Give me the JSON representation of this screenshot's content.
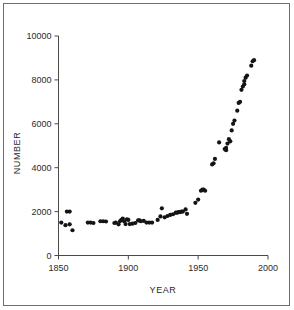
{
  "figure": {
    "caption": "",
    "background_color": "#ffffff",
    "border_color": "#6e6e6e",
    "marker_color": "#141414",
    "axis_color": "#4a4a4a"
  },
  "chart_data": {
    "type": "scatter",
    "title": "",
    "xlabel": "YEAR",
    "ylabel": "NUMBER",
    "xlim": [
      1850,
      2000
    ],
    "ylim": [
      0,
      10000
    ],
    "xticks": [
      1850,
      1900,
      1950,
      2000
    ],
    "xtick_labels": [
      "1850",
      "1900",
      "1950",
      "2000"
    ],
    "yticks": [
      0,
      2000,
      4000,
      6000,
      8000,
      10000
    ],
    "ytick_labels": [
      "0",
      "2000",
      "4000",
      "6000",
      "8000",
      "10000"
    ],
    "grid": false,
    "legend": null,
    "marker": "filled-circle",
    "marker_size_px": 3,
    "series": [
      {
        "name": "Number",
        "points": [
          [
            1852,
            1500
          ],
          [
            1855,
            1380
          ],
          [
            1856,
            2000
          ],
          [
            1858,
            2000
          ],
          [
            1858,
            1420
          ],
          [
            1860,
            1150
          ],
          [
            1871,
            1500
          ],
          [
            1873,
            1500
          ],
          [
            1875,
            1480
          ],
          [
            1880,
            1560
          ],
          [
            1882,
            1560
          ],
          [
            1884,
            1550
          ],
          [
            1890,
            1480
          ],
          [
            1891,
            1500
          ],
          [
            1893,
            1420
          ],
          [
            1894,
            1560
          ],
          [
            1895,
            1620
          ],
          [
            1896,
            1680
          ],
          [
            1897,
            1560
          ],
          [
            1898,
            1430
          ],
          [
            1899,
            1650
          ],
          [
            1900,
            1620
          ],
          [
            1901,
            1430
          ],
          [
            1903,
            1450
          ],
          [
            1905,
            1480
          ],
          [
            1907,
            1600
          ],
          [
            1908,
            1600
          ],
          [
            1909,
            1560
          ],
          [
            1911,
            1580
          ],
          [
            1913,
            1500
          ],
          [
            1915,
            1500
          ],
          [
            1917,
            1500
          ],
          [
            1921,
            1620
          ],
          [
            1923,
            1780
          ],
          [
            1924,
            2150
          ],
          [
            1926,
            1740
          ],
          [
            1928,
            1800
          ],
          [
            1930,
            1850
          ],
          [
            1932,
            1880
          ],
          [
            1934,
            1950
          ],
          [
            1935,
            1950
          ],
          [
            1936,
            1980
          ],
          [
            1937,
            1980
          ],
          [
            1938,
            2000
          ],
          [
            1939,
            2000
          ],
          [
            1941,
            2100
          ],
          [
            1942,
            1900
          ],
          [
            1948,
            2400
          ],
          [
            1950,
            2550
          ],
          [
            1952,
            2950
          ],
          [
            1953,
            3000
          ],
          [
            1954,
            3000
          ],
          [
            1955,
            2950
          ],
          [
            1960,
            4150
          ],
          [
            1961,
            4200
          ],
          [
            1962,
            4400
          ],
          [
            1965,
            5150
          ],
          [
            1969,
            4850
          ],
          [
            1970,
            4800
          ],
          [
            1970,
            4900
          ],
          [
            1971,
            5100
          ],
          [
            1972,
            5300
          ],
          [
            1973,
            5200
          ],
          [
            1974,
            5700
          ],
          [
            1975,
            6000
          ],
          [
            1976,
            6150
          ],
          [
            1978,
            6600
          ],
          [
            1979,
            6950
          ],
          [
            1980,
            7000
          ],
          [
            1981,
            7550
          ],
          [
            1982,
            7700
          ],
          [
            1983,
            7800
          ],
          [
            1983,
            7950
          ],
          [
            1984,
            8100
          ],
          [
            1985,
            8200
          ],
          [
            1988,
            8650
          ],
          [
            1989,
            8850
          ],
          [
            1990,
            8900
          ]
        ]
      }
    ]
  }
}
